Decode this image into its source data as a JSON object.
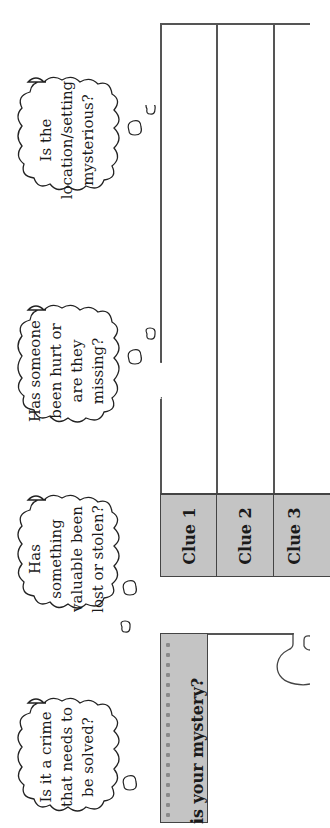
{
  "worksheet": {
    "orientation": "rotated-90-ccw",
    "thought_bubbles": [
      {
        "id": "setting",
        "lines": [
          "Is the",
          "location/setting",
          "mysterious?"
        ]
      },
      {
        "id": "missing",
        "lines": [
          "Has someone",
          "been hurt or",
          "are they",
          "missing?"
        ]
      },
      {
        "id": "stolen",
        "lines": [
          "Has",
          "something",
          "valuable been",
          "lost or stolen?"
        ]
      },
      {
        "id": "crime",
        "lines": [
          "Is it a crime",
          "that needs to",
          "be solved?"
        ]
      }
    ],
    "clue_table": {
      "headers": [
        "Clue 1",
        "Clue 2",
        "Clue 3"
      ],
      "cells": [
        "",
        "",
        ""
      ]
    },
    "mystery_prompt": {
      "label": "is your mystery?",
      "answer": ""
    },
    "colors": {
      "header_fill": "#c4c4c4",
      "border": "#444444",
      "dot": "#8a8a8a",
      "background": "#ffffff"
    }
  }
}
